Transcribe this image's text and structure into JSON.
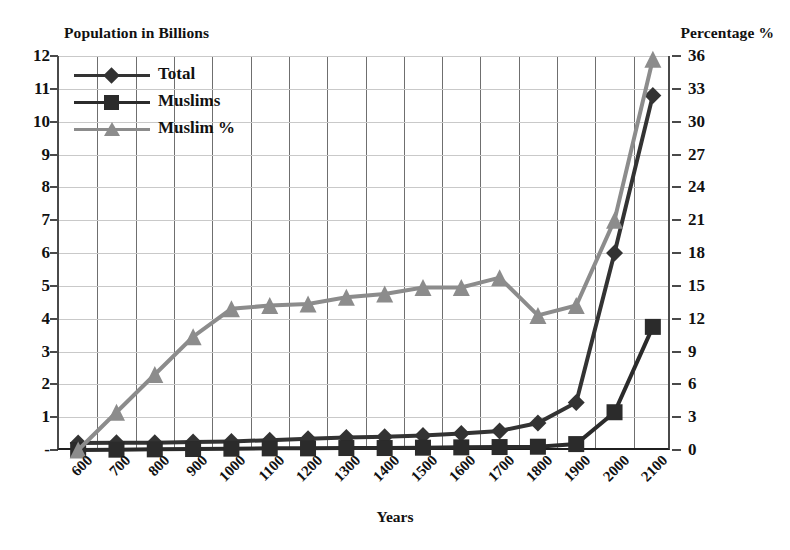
{
  "chart_data": {
    "type": "line",
    "title": "",
    "xlabel": "Years",
    "ylabel": "Population in Billions",
    "y2label": "Percentage %",
    "categories": [
      "600",
      "700",
      "800",
      "900",
      "1000",
      "1100",
      "1200",
      "1300",
      "1400",
      "1500",
      "1600",
      "1700",
      "1800",
      "1900",
      "2000",
      "2100"
    ],
    "ylim": [
      0,
      12
    ],
    "y2lim": [
      0,
      36
    ],
    "yticks": [
      "-",
      "1",
      "2",
      "3",
      "4",
      "5",
      "6",
      "7",
      "8",
      "9",
      "10",
      "11",
      "12"
    ],
    "ytick_values": [
      0,
      1,
      2,
      3,
      4,
      5,
      6,
      7,
      8,
      9,
      10,
      11,
      12
    ],
    "y2ticks": [
      "0",
      "3",
      "6",
      "9",
      "12",
      "15",
      "18",
      "21",
      "24",
      "27",
      "30",
      "33",
      "36"
    ],
    "y2tick_values": [
      0,
      3,
      6,
      9,
      12,
      15,
      18,
      21,
      24,
      27,
      30,
      33,
      36
    ],
    "grid": true,
    "legend_position": "top-left",
    "series": [
      {
        "name": "Total",
        "axis": "left",
        "marker": "diamond",
        "color": "#333333",
        "values": [
          0.21,
          0.22,
          0.22,
          0.24,
          0.26,
          0.3,
          0.34,
          0.38,
          0.4,
          0.44,
          0.5,
          0.58,
          0.82,
          1.45,
          6.0,
          10.8
        ]
      },
      {
        "name": "Muslims",
        "axis": "left",
        "marker": "square",
        "color": "#2b2b2b",
        "values": [
          0.0,
          0.01,
          0.02,
          0.03,
          0.04,
          0.05,
          0.05,
          0.06,
          0.06,
          0.07,
          0.08,
          0.09,
          0.1,
          0.18,
          1.15,
          3.75
        ]
      },
      {
        "name": "Muslim %",
        "axis": "right",
        "marker": "triangle",
        "color": "#8c8c8c",
        "values": [
          0.0,
          3.45,
          6.9,
          10.35,
          12.9,
          13.2,
          13.35,
          13.95,
          14.25,
          14.85,
          14.85,
          15.75,
          12.3,
          13.2,
          21.0,
          35.7
        ]
      }
    ]
  },
  "legend": {
    "items": [
      {
        "label": "Total"
      },
      {
        "label": "Muslims"
      },
      {
        "label": "Muslim %"
      }
    ]
  }
}
